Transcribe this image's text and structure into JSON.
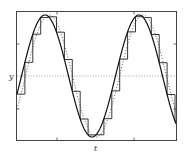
{
  "chart_data": {
    "type": "line",
    "title": "",
    "xlabel": "t",
    "ylabel": "y",
    "xlim": [
      0,
      1
    ],
    "ylim": [
      -1.1,
      1.1
    ],
    "grid": false,
    "legend": null,
    "reference_line": {
      "y": 0,
      "style": "dotted"
    },
    "series": [
      {
        "name": "continuous signal",
        "style": "solid",
        "function": "sin(2*pi*1.7*t - 0.37)"
      },
      {
        "name": "sampled signal (zero-order hold)",
        "style": "staircase",
        "step": 0.05
      },
      {
        "name": "delayed/smoothed signal",
        "style": "dotted"
      }
    ],
    "annotations": []
  },
  "axes": {
    "x_label": "t",
    "y_label": "y"
  },
  "colors": {
    "line": "#222222",
    "frame": "#444444",
    "reference": "#999999"
  }
}
